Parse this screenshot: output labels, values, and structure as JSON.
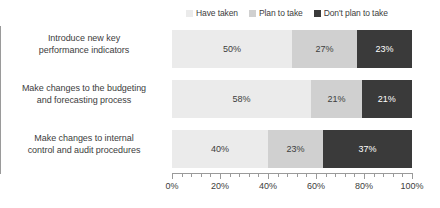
{
  "chart_data": {
    "type": "bar",
    "orientation": "horizontal",
    "stacked": true,
    "title": "",
    "subtitle": "",
    "xlabel": "",
    "ylabel": "",
    "xlim": [
      0,
      100
    ],
    "xticks": [
      "0%",
      "20%",
      "40%",
      "60%",
      "80%",
      "100%"
    ],
    "xtick_values": [
      0,
      20,
      40,
      60,
      80,
      100
    ],
    "minor_ticks_per_interval": 5,
    "grid": false,
    "legend_position": "top-right",
    "categories": [
      "Introduce new key performance indicators",
      "Make changes to the budgeting and forecasting process",
      "Make changes to internal control and audit procedures"
    ],
    "category_lines": [
      [
        "Introduce new key",
        "performance indicators"
      ],
      [
        "Make changes to the budgeting",
        "and forecasting process"
      ],
      [
        "Make changes to internal",
        "control and audit procedures"
      ]
    ],
    "series": [
      {
        "name": "Have taken",
        "color": "#ebebeb",
        "values": [
          50,
          58,
          40
        ],
        "labels": [
          "50%",
          "58%",
          "40%"
        ]
      },
      {
        "name": "Plan to take",
        "color": "#d0d0d0",
        "values": [
          27,
          21,
          23
        ],
        "labels": [
          "27%",
          "21%",
          "23%"
        ]
      },
      {
        "name": "Don't plan to take",
        "color": "#3a3a3a",
        "values": [
          23,
          21,
          37
        ],
        "labels": [
          "23%",
          "21%",
          "37%"
        ]
      }
    ]
  },
  "legend": {
    "items": [
      {
        "label": "Have taken",
        "color": "#ebebeb"
      },
      {
        "label": "Plan to take",
        "color": "#d0d0d0"
      },
      {
        "label": "Don't plan to take",
        "color": "#3a3a3a"
      }
    ]
  },
  "axis": {
    "x_tick_labels": [
      "0%",
      "20%",
      "40%",
      "60%",
      "80%",
      "100%"
    ]
  },
  "colors": {
    "have_taken": "#ebebeb",
    "plan_to_take": "#d0d0d0",
    "dont_plan_to_take": "#3a3a3a",
    "axis": "#9a9a9a",
    "text": "#3d3d3d",
    "background": "#ffffff"
  }
}
